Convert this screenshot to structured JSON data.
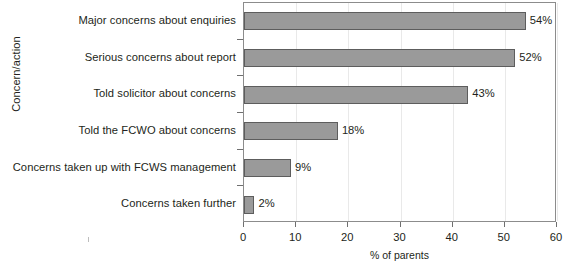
{
  "chart_data": {
    "type": "bar",
    "orientation": "horizontal",
    "title": "",
    "xlabel": "% of parents",
    "ylabel": "Concern/action",
    "xlim": [
      0,
      60
    ],
    "xticks": [
      0,
      10,
      20,
      30,
      40,
      50,
      60
    ],
    "grid": "vertical-light",
    "legend": "none",
    "categories": [
      "Major concerns about enquiries",
      "Serious concerns about report",
      "Told solicitor about concerns",
      "Told the FCWO about concerns",
      "Concerns taken up with FCWS management",
      "Concerns taken further"
    ],
    "values": [
      54,
      52,
      43,
      18,
      9,
      2
    ],
    "data_labels": [
      "54%",
      "52%",
      "43%",
      "18%",
      "9%",
      "2%"
    ],
    "colors": {
      "bar_fill": "#9a9a9a",
      "bar_border": "#5d5d5d",
      "axis": "#8c8c8c",
      "gridline": "#e9e9e9",
      "text": "#231f20",
      "background": "#ffffff"
    }
  }
}
